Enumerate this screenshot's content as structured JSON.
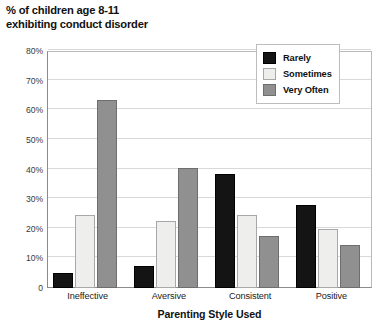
{
  "chart_data": {
    "type": "bar",
    "title": "% of children age 8-11 exhibiting conduct disorder",
    "title_lines": [
      "% of children age 8-11",
      "exhibiting conduct disorder"
    ],
    "xlabel": "Parenting Style Used",
    "ylabel": "",
    "categories": [
      "Ineffective",
      "Aversive",
      "Consistent",
      "Positive"
    ],
    "series": [
      {
        "name": "Rarely",
        "color": "#141414",
        "values": [
          5.0,
          7.5,
          38.5,
          28.0
        ]
      },
      {
        "name": "Sometimes",
        "color": "#eeeeec",
        "values": [
          24.5,
          22.5,
          24.5,
          19.8
        ]
      },
      {
        "name": "Very Often",
        "color": "#909090",
        "values": [
          63.5,
          40.5,
          17.5,
          14.5
        ]
      }
    ],
    "ylim": [
      0,
      80
    ],
    "ytick_values": [
      0,
      10,
      20,
      30,
      40,
      50,
      60,
      70,
      80
    ],
    "ytick_labels": [
      "0",
      "10%",
      "20%",
      "30%",
      "40%",
      "50%",
      "60%",
      "70%",
      "80%"
    ],
    "grid": true,
    "legend_position": "top-right",
    "legend_entries": [
      "Rarely",
      "Sometimes",
      "Very Often"
    ]
  }
}
